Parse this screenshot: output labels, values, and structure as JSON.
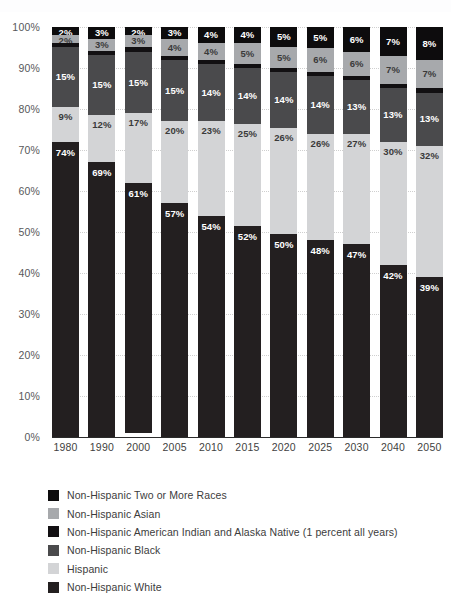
{
  "chart_data": {
    "type": "bar",
    "subtype": "stacked-percentage",
    "title": "",
    "xlabel": "",
    "ylabel": "",
    "ylim": [
      0,
      100
    ],
    "y_ticks": [
      "0%",
      "10%",
      "20%",
      "30%",
      "40%",
      "50%",
      "60%",
      "70%",
      "80%",
      "90%",
      "100%"
    ],
    "y_tick_values": [
      0,
      10,
      20,
      30,
      40,
      50,
      60,
      70,
      80,
      90,
      100
    ],
    "grid": "horizontal-dotted",
    "legend_position": "bottom-left",
    "legend_order": "top-of-stack-first",
    "categories": [
      "1980",
      "1990",
      "2000",
      "2005",
      "2010",
      "2015",
      "2020",
      "2025",
      "2030",
      "2040",
      "2050"
    ],
    "series": [
      {
        "name": "Non-Hispanic White",
        "color": "#231f20",
        "label_color": "#ffffff",
        "values": [
          74,
          69,
          61,
          57,
          54,
          52,
          50,
          48,
          47,
          42,
          39
        ],
        "labels": [
          "74%",
          "69%",
          "61%",
          "57%",
          "54%",
          "52%",
          "50%",
          "48%",
          "47%",
          "42%",
          "39%"
        ]
      },
      {
        "name": "Hispanic",
        "color": "#d3d4d6",
        "label_color": "#3a3a3a",
        "values": [
          9,
          12,
          17,
          20,
          23,
          25,
          26,
          26,
          27,
          30,
          32
        ],
        "labels": [
          "9%",
          "12%",
          "17%",
          "20%",
          "23%",
          "25%",
          "26%",
          "26%",
          "27%",
          "30%",
          "32%"
        ]
      },
      {
        "name": "Non-Hispanic Black",
        "color": "#4a4a4c",
        "label_color": "#ffffff",
        "values": [
          15,
          15,
          15,
          15,
          14,
          14,
          14,
          14,
          13,
          13,
          13
        ],
        "labels": [
          "15%",
          "15%",
          "15%",
          "15%",
          "14%",
          "14%",
          "14%",
          "14%",
          "13%",
          "13%",
          "13%"
        ]
      },
      {
        "name": "Non-Hispanic American Indian and Alaska Native (1 percent all years)",
        "color": "#121012",
        "label_color": "#ffffff",
        "values": [
          1,
          1,
          1,
          1,
          1,
          1,
          1,
          1,
          1,
          1,
          1
        ],
        "labels": [
          "",
          "",
          "",
          "",
          "",
          "",
          "",
          "",
          "",
          "",
          ""
        ]
      },
      {
        "name": "Non-Hispanic Asian",
        "color": "#a7a9ac",
        "label_color": "#3a3a3a",
        "values": [
          2,
          3,
          3,
          4,
          4,
          5,
          5,
          6,
          6,
          7,
          7
        ],
        "labels": [
          "2%",
          "3%",
          "3%",
          "4%",
          "4%",
          "5%",
          "5%",
          "6%",
          "6%",
          "7%",
          "7%"
        ]
      },
      {
        "name": "Non-Hispanic Two or More Races",
        "color": "#0d0c0d",
        "label_color": "#ffffff",
        "values": [
          2,
          3,
          2,
          3,
          4,
          4,
          5,
          5,
          6,
          7,
          8
        ],
        "labels": [
          "2%",
          "3%",
          "2%",
          "3%",
          "4%",
          "4%",
          "5%",
          "5%",
          "6%",
          "7%",
          "8%"
        ]
      }
    ]
  },
  "legend": {
    "items": [
      {
        "label": "Non-Hispanic Two or More Races",
        "color": "#0d0c0d"
      },
      {
        "label": "Non-Hispanic Asian",
        "color": "#a7a9ac"
      },
      {
        "label": "Non-Hispanic American Indian and Alaska Native (1 percent all years)",
        "color": "#121012"
      },
      {
        "label": "Non-Hispanic Black",
        "color": "#4a4a4c"
      },
      {
        "label": "Hispanic",
        "color": "#d3d4d6"
      },
      {
        "label": "Non-Hispanic White",
        "color": "#231f20"
      }
    ]
  }
}
